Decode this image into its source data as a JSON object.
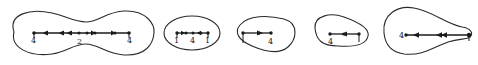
{
  "figure": {
    "panels": [
      {
        "id": "panel-1",
        "shape": "dumbbell",
        "labels": [
          "4",
          "2",
          "4"
        ],
        "arrow_directions": [
          "left",
          "left",
          "left",
          "right",
          "right"
        ]
      },
      {
        "id": "panel-2",
        "shape": "ellipse",
        "labels": [
          "1",
          "4",
          "1"
        ],
        "arrow_directions": [
          "right",
          "left"
        ]
      },
      {
        "id": "panel-3",
        "shape": "rounded-triangle-right",
        "labels": [
          "1",
          "4"
        ],
        "arrow_directions": [
          "right"
        ]
      },
      {
        "id": "panel-4",
        "shape": "rounded-triangle-right",
        "labels": [
          "4",
          "1"
        ],
        "arrow_directions": [
          "left"
        ]
      },
      {
        "id": "panel-5",
        "shape": "teardrop",
        "labels": [
          "4",
          "1"
        ],
        "arrow_directions": [
          "left",
          "left",
          "left"
        ]
      }
    ]
  }
}
